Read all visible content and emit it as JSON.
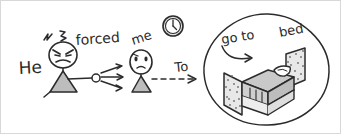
{
  "scene": {
    "title": "He forced me To go to bed",
    "style": "hand-drawn sketch",
    "background_color": "#ffffff",
    "ink_color": "#2b2b2b",
    "fill_gray": "#b9b9b9",
    "frame_color": "#cccccc"
  },
  "labels": {
    "he": "He",
    "forced": "forced",
    "me": "me",
    "to": "To",
    "go_to": "go to",
    "bed": "bed"
  },
  "icons": {
    "anger_marks": "anger-marks-icon",
    "clock": "clock-icon",
    "pointing_arrows": "pointing-arrows-icon",
    "dashed_arrow": "dashed-arrow-icon",
    "curved_arrow": "curved-arrow-icon",
    "bed": "bed-icon"
  },
  "figures": {
    "angry_person": {
      "name": "He",
      "expression": "angry",
      "gesture": "pointing"
    },
    "sad_person": {
      "name": "me",
      "expression": "sad"
    }
  },
  "bubble": {
    "contents": "bed",
    "caption_left": "go to",
    "caption_right": "bed"
  }
}
